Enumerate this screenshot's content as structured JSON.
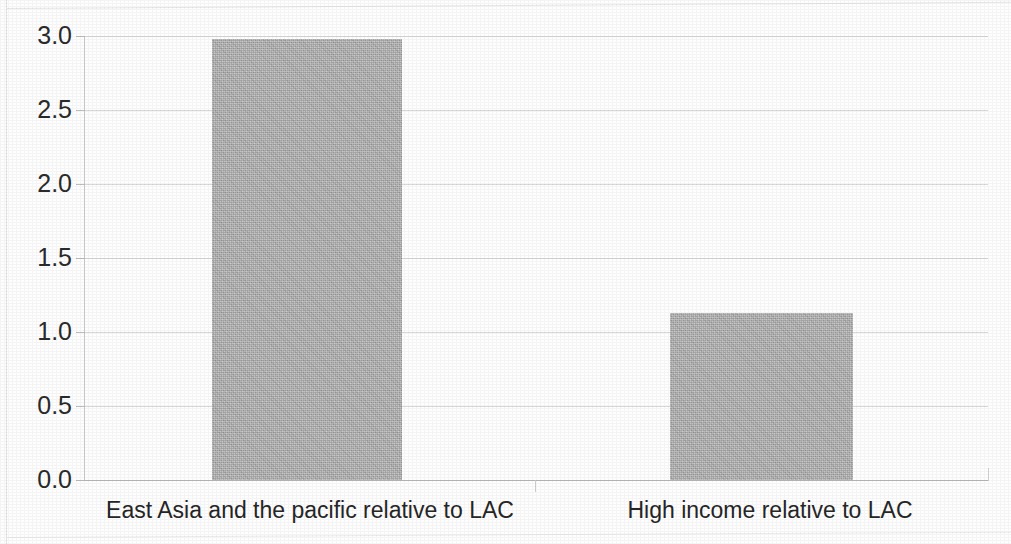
{
  "chart_data": {
    "type": "bar",
    "title": "",
    "subtitle": "",
    "xlabel": "",
    "ylabel": "",
    "categories": [
      "East Asia and the pacific relative to LAC",
      "High income relative to LAC"
    ],
    "values": [
      2.98,
      1.13
    ],
    "ylim": [
      0.0,
      3.0
    ],
    "ytick_labels": [
      "3.0",
      "2.5",
      "2.0",
      "1.5",
      "1.0",
      "0.5",
      "0.0"
    ],
    "ytick_values": [
      3.0,
      2.5,
      2.0,
      1.5,
      1.0,
      0.5,
      0.0
    ],
    "grid": true,
    "legend": false,
    "legend_position": "none",
    "bar_color": "#ababab",
    "gridline_color": "#d8d8d8",
    "axis_color": "#bdbdbd",
    "text_color": "#262626",
    "background_color": "#fefefe"
  },
  "axis": {
    "y_ticks": [
      {
        "label": "3.0",
        "value": 3.0
      },
      {
        "label": "2.5",
        "value": 2.5
      },
      {
        "label": "2.0",
        "value": 2.0
      },
      {
        "label": "1.5",
        "value": 1.5
      },
      {
        "label": "1.0",
        "value": 1.0
      },
      {
        "label": "0.5",
        "value": 0.5
      },
      {
        "label": "0.0",
        "value": 0.0
      }
    ]
  },
  "bars": [
    {
      "label": "East Asia and the pacific relative to LAC",
      "value": 2.98
    },
    {
      "label": "High income relative to LAC",
      "value": 1.13
    }
  ]
}
